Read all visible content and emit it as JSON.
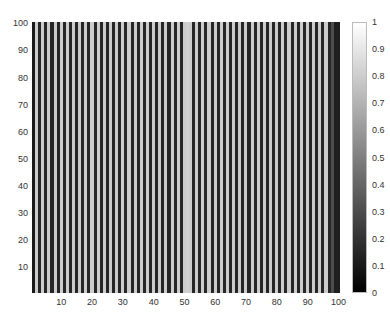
{
  "chart_data": {
    "type": "heatmap",
    "title": "",
    "xlabel": "",
    "ylabel": "",
    "xlim": [
      0.5,
      100.5
    ],
    "ylim": [
      0.5,
      100.5
    ],
    "x_ticks": [
      10,
      20,
      30,
      40,
      50,
      60,
      70,
      80,
      90,
      100
    ],
    "y_ticks": [
      10,
      20,
      30,
      40,
      50,
      60,
      70,
      80,
      90,
      100
    ],
    "colormap": "gray",
    "clim": [
      0,
      1
    ],
    "colorbar_ticks": [
      0,
      0.1,
      0.2,
      0.3,
      0.4,
      0.5,
      0.6,
      0.7,
      0.8,
      0.9,
      1
    ],
    "column_values": [
      0.1,
      0.8,
      0.15,
      0.8,
      0.15,
      0.8,
      0.15,
      0.8,
      0.15,
      0.8,
      0.15,
      0.8,
      0.15,
      0.8,
      0.15,
      0.8,
      0.15,
      0.8,
      0.15,
      0.8,
      0.15,
      0.8,
      0.15,
      0.8,
      0.15,
      0.8,
      0.15,
      0.8,
      0.15,
      0.8,
      0.15,
      0.8,
      0.15,
      0.8,
      0.15,
      0.8,
      0.15,
      0.8,
      0.15,
      0.8,
      0.15,
      0.8,
      0.15,
      0.8,
      0.15,
      0.8,
      0.15,
      0.8,
      0.15,
      0.8,
      0.82,
      0.8,
      0.15,
      0.8,
      0.15,
      0.8,
      0.15,
      0.8,
      0.15,
      0.8,
      0.15,
      0.8,
      0.15,
      0.8,
      0.15,
      0.8,
      0.15,
      0.8,
      0.15,
      0.8,
      0.15,
      0.8,
      0.15,
      0.8,
      0.15,
      0.8,
      0.15,
      0.8,
      0.15,
      0.8,
      0.15,
      0.8,
      0.15,
      0.8,
      0.15,
      0.8,
      0.15,
      0.8,
      0.15,
      0.8,
      0.15,
      0.8,
      0.15,
      0.8,
      0.15,
      0.8,
      0.15,
      0.3,
      0.12,
      0.12
    ]
  }
}
